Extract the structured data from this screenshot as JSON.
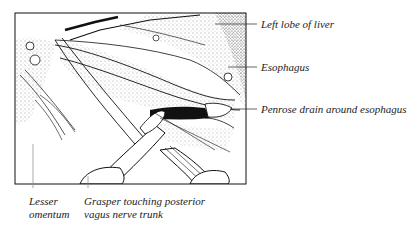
{
  "figure": {
    "type": "surgical illustration",
    "labels": {
      "left_lobe_liver": "Left lobe of liver",
      "esophagus": "Esophagus",
      "penrose_drain": "Penrose drain around esophagus",
      "lesser_omentum_line1": "Lesser",
      "lesser_omentum_line2": "omentum",
      "grasper_line1": "Grasper touching posterior",
      "grasper_line2": "vagus nerve trunk"
    }
  }
}
